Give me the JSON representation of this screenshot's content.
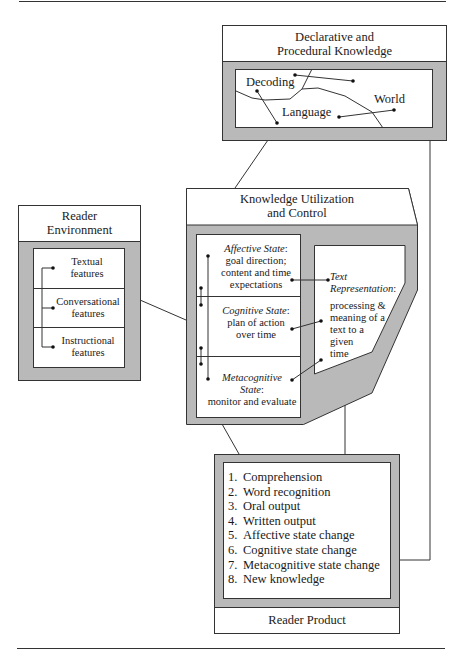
{
  "colors": {
    "shade": "#b9b9b9",
    "line": "#333333",
    "paper": "#ffffff"
  },
  "knowledge_base": {
    "title_line1": "Declarative and",
    "title_line2": "Procedural Knowledge",
    "nodes": {
      "decoding": "Decoding",
      "language": "Language",
      "world": "World"
    }
  },
  "reader_environment": {
    "title_line1": "Reader",
    "title_line2": "Environment",
    "features": [
      {
        "line1": "Textual",
        "line2": "features"
      },
      {
        "line1": "Conversational",
        "line2": "features"
      },
      {
        "line1": "Instructional",
        "line2": "features"
      }
    ]
  },
  "knowledge_utilization": {
    "title_line1": "Knowledge Utilization",
    "title_line2": "and Control",
    "states": [
      {
        "name": "Affective State",
        "desc1": "goal direction;",
        "desc2": "content and time",
        "desc3": "expectations"
      },
      {
        "name": "Cognitive State",
        "desc1": "plan of action",
        "desc2": "over time"
      },
      {
        "name_line1": "Metacognitive",
        "name_line2": "State",
        "desc1": "monitor and evaluate"
      }
    ],
    "text_representation": {
      "name_line1": "Text",
      "name_line2": "Representation",
      "desc": [
        "processing &",
        "meaning of a",
        "text to a",
        "given",
        "time"
      ]
    }
  },
  "reader_product": {
    "title": "Reader Product",
    "items": [
      {
        "num": "1.",
        "label": "Comprehension"
      },
      {
        "num": "2.",
        "label": "Word recognition"
      },
      {
        "num": "3.",
        "label": "Oral output"
      },
      {
        "num": "4.",
        "label": "Written output"
      },
      {
        "num": "5.",
        "label": "Affective state change"
      },
      {
        "num": "6.",
        "label": "Cognitive state change"
      },
      {
        "num": "7.",
        "label": "Metacognitive state change"
      },
      {
        "num": "8.",
        "label": "New knowledge"
      }
    ]
  }
}
